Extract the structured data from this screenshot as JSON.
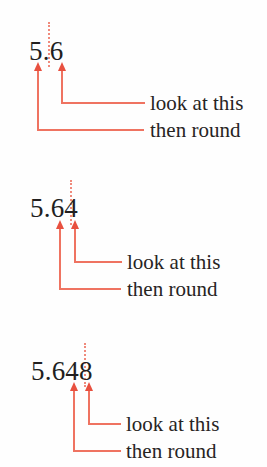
{
  "page": {
    "background_color": "#fefefe",
    "text_color": "#221f1f",
    "accent_color": "#ef7361",
    "arrowhead_color": "#e8503f",
    "divider_color": "#f08a7c"
  },
  "labels": {
    "look": "look at this",
    "round": "then round"
  },
  "examples": [
    {
      "id": "one-decimal-place",
      "numeral": "5.6",
      "look_at_digit": "6",
      "round_digit": "5",
      "look_label": "look at this",
      "round_label": "then round"
    },
    {
      "id": "two-decimal-places",
      "numeral": "5.64",
      "look_at_digit": "4",
      "round_digit": "6",
      "look_label": "look at this",
      "round_label": "then round"
    },
    {
      "id": "three-decimal-places",
      "numeral": "5.648",
      "look_at_digit": "8",
      "round_digit": "4",
      "look_label": "look at this",
      "round_label": "then round"
    }
  ]
}
